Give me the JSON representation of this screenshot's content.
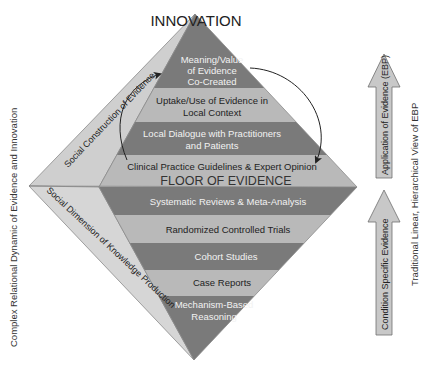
{
  "title": "INNOVATION",
  "floor_label": "FLOOR OF EVIDENCE",
  "colors": {
    "dark_band": "#7a7a7a",
    "light_band": "#b9b9b9",
    "left_face_upper": "#cfcfcf",
    "left_face_lower": "#d6d6d6",
    "arrow_fill": "#c8c8c8",
    "arrow_stroke": "#6e6e6e",
    "text_dark": "#222222",
    "text_light": "#f2f2f2"
  },
  "upper_bands": [
    {
      "lines": [
        "Meaning/Value",
        "of Evidence",
        "Co-Created"
      ],
      "shade": "dark"
    },
    {
      "lines": [
        "Uptake/Use of Evidence in",
        "Local Context"
      ],
      "shade": "light"
    },
    {
      "lines": [
        "Local Dialogue with Practitioners",
        "and Patients"
      ],
      "shade": "dark"
    },
    {
      "lines": [
        "Clinical Practice Guidelines & Expert Opinion"
      ],
      "shade": "light"
    }
  ],
  "lower_bands": [
    {
      "lines": [
        "Systematic Reviews & Meta-Analysis"
      ],
      "shade": "dark"
    },
    {
      "lines": [
        "Randomized Controlled Trials"
      ],
      "shade": "light"
    },
    {
      "lines": [
        "Cohort Studies"
      ],
      "shade": "dark"
    },
    {
      "lines": [
        "Case Reports"
      ],
      "shade": "light"
    },
    {
      "lines": [
        "Mechanism-Based",
        "Reasoning"
      ],
      "shade": "dark"
    }
  ],
  "side_faces": {
    "upper_label": "Social Construction of Evidence",
    "lower_label": "Social Dimension of Knowledge Production"
  },
  "left_axis_label": "Complex Relational Dynamic of Evidence and Innovation",
  "right_axis_label": "Traditional Linear, Hierarchical View of EBP",
  "right_arrows": {
    "upper": "Application of Evidence (EBP)",
    "lower": "Condition Specific Evidence"
  }
}
